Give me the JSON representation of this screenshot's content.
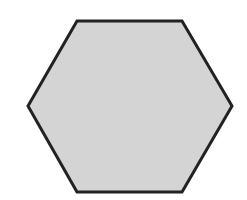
{
  "diagram": {
    "shape": "hexagon",
    "orientation": "flat-top",
    "fill": "#d4d4d4",
    "stroke": "#222222",
    "stroke_width": 3,
    "vertices": [
      [
        77,
        21
      ],
      [
        182,
        21
      ],
      [
        232,
        106
      ],
      [
        182,
        192
      ],
      [
        77,
        192
      ],
      [
        28,
        106
      ]
    ]
  }
}
